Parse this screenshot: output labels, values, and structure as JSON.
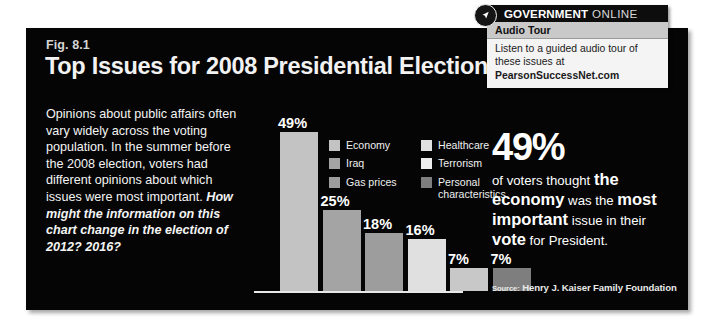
{
  "figure": {
    "number": "Fig. 8.1",
    "title": "Top Issues for 2008 Presidential Election",
    "description_plain": "Opinions about public affairs often vary widely across the voting population. In the summer before the 2008 election, voters had different opinions about which issues were most important. ",
    "description_emphasis": "How might the information on this chart change in the election of 2012? 2016?",
    "source": "Henry J. Kaiser Family Foundation",
    "source_prefix": "Source:"
  },
  "chart_data": {
    "type": "bar",
    "title": "Top Issues for 2008 Presidential Election",
    "xlabel": "",
    "ylabel": "",
    "ylim": [
      0,
      55
    ],
    "grid": false,
    "legend_position": "inside-top-right",
    "categories": [
      "Economy",
      "Iraq",
      "Gas prices",
      "Healthcare",
      "Terrorism",
      "Personal characteristics"
    ],
    "values": [
      49,
      25,
      18,
      16,
      7,
      7
    ],
    "value_labels": [
      "49%",
      "25%",
      "18%",
      "16%",
      "7%",
      "7%"
    ],
    "colors": [
      "#c3c3c3",
      "#a4a4a4",
      "#9d9d9d",
      "#e0e0e0",
      "#c8c8c8",
      "#7e7e7e"
    ]
  },
  "legend": {
    "columns": [
      [
        {
          "label": "Economy",
          "color": "#c3c3c3"
        },
        {
          "label": "Iraq",
          "color": "#a4a4a4"
        },
        {
          "label": "Gas prices",
          "color": "#9d9d9d"
        }
      ],
      [
        {
          "label": "Healthcare",
          "color": "#e0e0e0"
        },
        {
          "label": "Terrorism",
          "color": "#ededed"
        },
        {
          "label": "Personal characteristics",
          "color": "#7e7e7e"
        }
      ]
    ]
  },
  "callout": {
    "big_number": "49%",
    "line1_regular": "of voters thought ",
    "line1_bold": "the",
    "line2_bold_a": "economy",
    "line2_regular_a": " was the ",
    "line2_bold_b": "most",
    "line3_bold_a": "important",
    "line3_regular_a": " issue in their",
    "line4_bold": "vote",
    "line4_regular": " for President."
  },
  "gov_online": {
    "brand_strong": "GOVERNMENT",
    "brand_light": "ONLINE",
    "badge_icon": "arrow-cursor-icon",
    "subhead": "Audio Tour",
    "body": "Listen to a guided audio tour of these issues at",
    "url": "PearsonSuccessNet.com"
  }
}
